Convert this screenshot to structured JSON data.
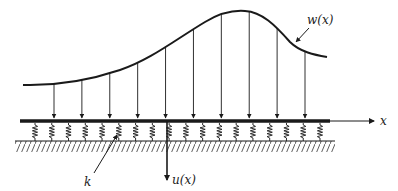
{
  "diagram": {
    "type": "beam-on-elastic-foundation",
    "labels": {
      "load": "w(x)",
      "axis": "x",
      "deflection": "u(x)",
      "stiffness": "k"
    },
    "load_arrow_count": 10,
    "spring_count": 18,
    "colors": {
      "ink": "#1a1a1a",
      "background": "#ffffff"
    }
  }
}
